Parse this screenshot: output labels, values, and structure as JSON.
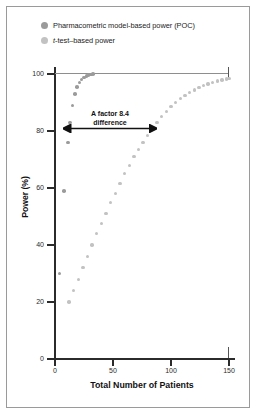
{
  "figure": {
    "border_color": "#9a9a9a",
    "background": "#ffffff"
  },
  "legend": {
    "position": "top-left",
    "items": [
      {
        "label": "Pharmacometric model-based power (POC)",
        "color": "#9b9b9b",
        "marker": "circle",
        "icon": "legend-dot-icon"
      },
      {
        "label_pre": "t",
        "label_post": "-test–based power",
        "color": "#c2c2c2",
        "marker": "circle",
        "icon": "legend-dot-icon"
      }
    ]
  },
  "annotation": {
    "line1": "A factor 8.4",
    "line2": "difference",
    "arrow": "double-headed-horizontal",
    "at_power": 82
  },
  "chart_data": {
    "type": "scatter",
    "title": "",
    "xlabel": "Total Number of Patients",
    "ylabel": "Power (%)",
    "xlim": [
      0,
      150
    ],
    "ylim": [
      0,
      100
    ],
    "xticks": [
      0,
      50,
      100,
      150
    ],
    "yticks": [
      0,
      20,
      40,
      60,
      80,
      100
    ],
    "grid": "top-only",
    "legend_position": "above-plot",
    "series": [
      {
        "name": "Pharmacometric model-based power (POC)",
        "color": "#9b9b9b",
        "points": [
          [
            4,
            30
          ],
          [
            8,
            59
          ],
          [
            11,
            76
          ],
          [
            13,
            83
          ],
          [
            15,
            89
          ],
          [
            17,
            93
          ],
          [
            19,
            95.5
          ],
          [
            21,
            97
          ],
          [
            23,
            98
          ],
          [
            25,
            98.8
          ],
          [
            27,
            99.3
          ],
          [
            29,
            99.6
          ],
          [
            31,
            99.8
          ],
          [
            33,
            99.9
          ]
        ]
      },
      {
        "name": "t-test-based power",
        "color": "#c2c2c2",
        "points": [
          [
            12,
            20
          ],
          [
            16,
            24
          ],
          [
            20,
            28
          ],
          [
            24,
            32
          ],
          [
            28,
            36
          ],
          [
            32,
            40
          ],
          [
            36,
            44
          ],
          [
            40,
            47.5
          ],
          [
            44,
            51
          ],
          [
            48,
            55
          ],
          [
            52,
            58
          ],
          [
            56,
            61.5
          ],
          [
            60,
            65
          ],
          [
            64,
            68
          ],
          [
            68,
            71
          ],
          [
            72,
            73.5
          ],
          [
            76,
            76
          ],
          [
            80,
            78.5
          ],
          [
            84,
            81
          ],
          [
            88,
            83
          ],
          [
            92,
            85
          ],
          [
            96,
            86.8
          ],
          [
            100,
            88.5
          ],
          [
            104,
            90
          ],
          [
            108,
            91.3
          ],
          [
            112,
            92.5
          ],
          [
            116,
            93.5
          ],
          [
            120,
            94.4
          ],
          [
            124,
            95.2
          ],
          [
            128,
            95.9
          ],
          [
            132,
            96.5
          ],
          [
            136,
            97
          ],
          [
            140,
            97.5
          ],
          [
            144,
            97.9
          ],
          [
            148,
            98.3
          ],
          [
            150,
            98.5
          ]
        ]
      }
    ]
  }
}
